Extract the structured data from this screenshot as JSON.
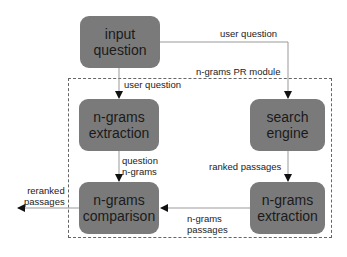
{
  "diagram": {
    "module_label": "n-grams PR module",
    "nodes": {
      "input_question": [
        "input",
        "question"
      ],
      "ngrams_extraction_left": [
        "n-grams",
        "extraction"
      ],
      "search_engine": [
        "search",
        "engine"
      ],
      "ngrams_comparison": [
        "n-grams",
        "comparison"
      ],
      "ngrams_extraction_right": [
        "n-grams",
        "extraction"
      ]
    },
    "edges": {
      "input_to_search": "user question",
      "input_to_extraction": "user question",
      "extraction_to_comparison": [
        "question",
        "n-grams"
      ],
      "search_to_extraction": "ranked passages",
      "extraction_to_comparison_right": [
        "n-grams",
        "passages"
      ],
      "comparison_output": [
        "reranked",
        "passages"
      ]
    },
    "colors": {
      "node_fill": "#7a7a7a",
      "line": "#888888",
      "text": "#1a1a1a"
    }
  }
}
